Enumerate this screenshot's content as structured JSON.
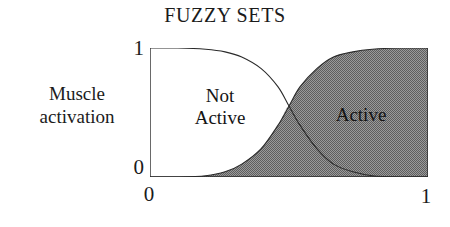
{
  "figure": {
    "title": "FUZZY SETS",
    "y_axis": {
      "label_line1": "Muscle",
      "label_line2": "activation",
      "tick_top": "1",
      "tick_bottom": "0"
    },
    "x_axis": {
      "tick_left": "0",
      "tick_right": "1"
    },
    "regions": {
      "not_active_line1": "Not",
      "not_active_line2": "Active",
      "active": "Active"
    },
    "colors": {
      "background": "#ffffff",
      "axis_line": "#2a2a2a",
      "curve_line": "#2a2a2a",
      "active_fill": "#888888",
      "overlap_fill": "#d8d8d8",
      "text": "#1b1b1b"
    }
  },
  "chart_data": {
    "type": "line",
    "title": "FUZZY SETS",
    "xlabel": "",
    "ylabel": "Muscle activation",
    "xlim": [
      0,
      1
    ],
    "ylim": [
      0,
      1
    ],
    "xticks": [
      0,
      1
    ],
    "yticks": [
      0,
      1
    ],
    "grid": false,
    "legend": "in-plot region labels",
    "annotations": [
      "Not Active",
      "Active"
    ],
    "series": [
      {
        "name": "Not Active",
        "fill": "none",
        "x": [
          0.0,
          0.1,
          0.2,
          0.27,
          0.33,
          0.4,
          0.46,
          0.5,
          0.54,
          0.6,
          0.66,
          0.73,
          0.8,
          0.9,
          1.0
        ],
        "values": [
          1.0,
          1.0,
          0.99,
          0.97,
          0.93,
          0.84,
          0.7,
          0.55,
          0.4,
          0.22,
          0.1,
          0.04,
          0.01,
          0.0,
          0.0
        ]
      },
      {
        "name": "Active",
        "fill": "#888888",
        "x": [
          0.0,
          0.1,
          0.2,
          0.27,
          0.33,
          0.4,
          0.46,
          0.5,
          0.54,
          0.6,
          0.66,
          0.73,
          0.8,
          0.9,
          1.0
        ],
        "values": [
          0.0,
          0.0,
          0.01,
          0.04,
          0.1,
          0.22,
          0.4,
          0.55,
          0.7,
          0.84,
          0.93,
          0.97,
          0.99,
          1.0,
          1.0
        ]
      }
    ],
    "crossing_point": {
      "x": 0.5,
      "y": 0.55
    }
  }
}
